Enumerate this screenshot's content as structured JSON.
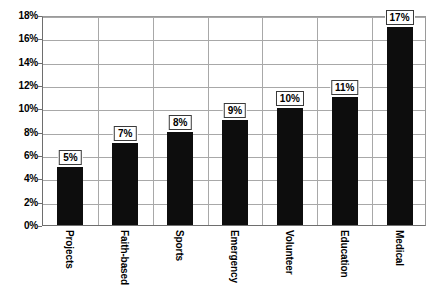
{
  "chart_data": {
    "type": "bar",
    "title": "",
    "subtitle": "",
    "xlabel": "",
    "ylabel": "",
    "categories": [
      "Projects",
      "Faith-based",
      "Sports",
      "Emergency",
      "Volunteer",
      "Education",
      "Medical"
    ],
    "values": [
      5,
      7,
      8,
      9,
      10,
      11,
      17
    ],
    "data_labels": [
      "5%",
      "7%",
      "8%",
      "9%",
      "10%",
      "11%",
      "17%"
    ],
    "ylim": [
      0,
      18
    ],
    "ytick_values": [
      0,
      2,
      4,
      6,
      8,
      10,
      12,
      14,
      16,
      18
    ],
    "ytick_labels": [
      "0%",
      "2%",
      "4%",
      "6%",
      "8%",
      "10%",
      "12%",
      "14%",
      "16%",
      "18%"
    ],
    "grid": {
      "horizontal": true,
      "vertical": true
    },
    "legend": {
      "visible": false,
      "position": "none"
    },
    "colors": {
      "bar": "#0d0d0d",
      "gridline": "#a8a8a8",
      "axis": "#6e6e6e",
      "background": "#ffffff",
      "label_box_border": "#3a3a3a",
      "text": "#000000"
    },
    "data_label_rotation": 0,
    "category_label_rotation": 90
  }
}
